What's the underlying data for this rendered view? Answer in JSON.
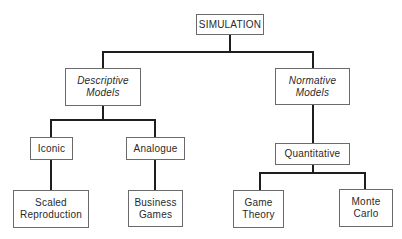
{
  "diagram": {
    "type": "hierarchy-tree",
    "root": {
      "label": "SIMULATION"
    },
    "level1": [
      {
        "line1": "Descriptive",
        "line2": "Models",
        "style": "italic"
      },
      {
        "line1": "Normative",
        "line2": "Models",
        "style": "italic"
      }
    ],
    "level2": [
      {
        "label": "Iconic",
        "parent": "Descriptive Models"
      },
      {
        "label": "Analogue",
        "parent": "Descriptive Models"
      },
      {
        "label": "Quantitative",
        "parent": "Normative Models"
      }
    ],
    "level3": [
      {
        "line1": "Scaled",
        "line2": "Reproduction",
        "parent": "Iconic"
      },
      {
        "line1": "Business",
        "line2": "Games",
        "parent": "Analogue"
      },
      {
        "line1": "Game",
        "line2": "Theory",
        "parent": "Quantitative"
      },
      {
        "line1": "Monte",
        "line2": "Carlo",
        "parent": "Quantitative"
      }
    ]
  },
  "colors": {
    "line": "#1e1e1e",
    "border": "#6a6a6a",
    "background": "#ffffff"
  }
}
